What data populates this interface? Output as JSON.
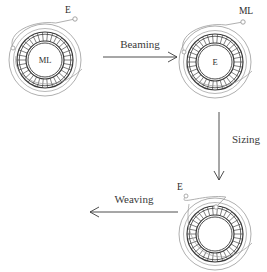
{
  "figure": {
    "background_color": "#ffffff",
    "ink_color": "#3a3a3a",
    "pale_ink_color": "#9a9a9a",
    "hatch_color": "#4a4a4a"
  },
  "arrows": [
    {
      "id": "beaming",
      "label": "Beaming",
      "direction": "right",
      "x1": 103,
      "y1": 57,
      "x2": 177,
      "y2": 57,
      "label_x": 140,
      "label_y": 48
    },
    {
      "id": "sizing",
      "label": "Sizing",
      "direction": "down",
      "x1": 219,
      "y1": 112,
      "x2": 219,
      "y2": 180,
      "label_x": 232,
      "label_y": 143
    },
    {
      "id": "weaving",
      "label": "Weaving",
      "direction": "left",
      "x1": 178,
      "y1": 212,
      "x2": 90,
      "y2": 212,
      "label_x": 134,
      "label_y": 203
    }
  ],
  "bobbins": [
    {
      "id": "bobbin-ml",
      "center_label": "ML",
      "end_label": "E",
      "cx": 45,
      "cy": 60,
      "r_outer": 36,
      "r_ring_outer": 28,
      "r_ring_inner": 19,
      "r_core": 17,
      "hatch_count": 34,
      "thread_start_x": 13,
      "thread_start_y": 48,
      "thread_end_x": 75,
      "thread_end_y": 19,
      "end_dot_x": 75,
      "end_dot_y": 19,
      "start_dot_x": 13,
      "start_dot_y": 48,
      "end_label_x": 68,
      "end_label_y": 13,
      "end_label_anchor": "middle"
    },
    {
      "id": "bobbin-e",
      "center_label": "E",
      "end_label": "ML",
      "cx": 215,
      "cy": 62,
      "r_outer": 36,
      "r_ring_outer": 28,
      "r_ring_inner": 19,
      "r_core": 17,
      "hatch_count": 34,
      "thread_start_x": 184,
      "thread_start_y": 52,
      "thread_end_x": 243,
      "thread_end_y": 22,
      "end_dot_x": 243,
      "end_dot_y": 22,
      "start_dot_x": 184,
      "start_dot_y": 52,
      "end_label_x": 246,
      "end_label_y": 14,
      "end_label_anchor": "middle"
    },
    {
      "id": "bobbin-empty",
      "center_label": "",
      "end_label": "E",
      "cx": 215,
      "cy": 234,
      "r_outer": 36,
      "r_ring_outer": 28,
      "r_ring_inner": 19,
      "r_core": 17,
      "hatch_count": 34,
      "thread_start_x": 186,
      "thread_start_y": 196,
      "thread_end_x": 216,
      "thread_end_y": 207,
      "end_dot_x": 216,
      "end_dot_y": 207,
      "start_dot_x": 186,
      "start_dot_y": 196,
      "end_label_x": 180,
      "end_label_y": 190,
      "end_label_anchor": "middle"
    }
  ]
}
